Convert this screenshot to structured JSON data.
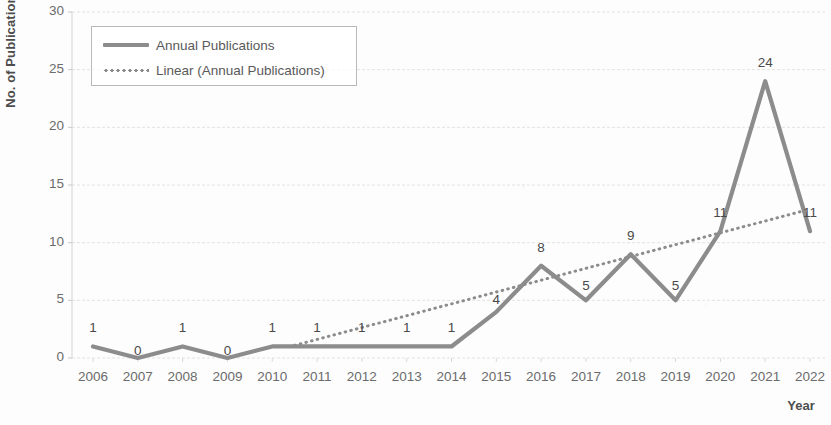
{
  "chart_data": {
    "type": "line",
    "title": "",
    "xlabel": "Year",
    "ylabel": "No. of Publications",
    "categories": [
      "2006",
      "2007",
      "2008",
      "2009",
      "2010",
      "2011",
      "2012",
      "2013",
      "2014",
      "2015",
      "2016",
      "2017",
      "2018",
      "2019",
      "2020",
      "2021",
      "2022"
    ],
    "series": [
      {
        "name": "Annual Publications",
        "style": "solid",
        "color": "#8c8c8c",
        "values": [
          1,
          0,
          1,
          0,
          1,
          1,
          1,
          1,
          1,
          4,
          8,
          5,
          9,
          5,
          11,
          24,
          11
        ],
        "data_labels": [
          "1",
          "0",
          "1",
          "0",
          "1",
          "1",
          "1",
          "1",
          "1",
          "4",
          "8",
          "5",
          "9",
          "5",
          "11",
          "24",
          "11"
        ]
      },
      {
        "name": "Linear (Annual Publications)",
        "style": "dotted",
        "color": "#8c8c8c",
        "trend_start": {
          "x_index": 4.5,
          "value": 1.1
        },
        "trend_end": {
          "x_index": 15.8,
          "value": 12.7
        },
        "values": [
          null,
          null,
          null,
          null,
          1.1,
          2.1,
          3.2,
          4.2,
          5.2,
          6.2,
          7.2,
          8.2,
          9.3,
          10.3,
          11.3,
          12.3,
          12.7
        ]
      }
    ],
    "ylim": [
      0,
      30
    ],
    "yticks": [
      0,
      5,
      10,
      15,
      20,
      25,
      30
    ],
    "ytick_labels": [
      "0",
      "5",
      "10",
      "15",
      "20",
      "25",
      "30"
    ],
    "grid": "horizontal-dashed",
    "legend_position": "top-left",
    "legend_entries": [
      {
        "label": "Annual Publications",
        "style": "solid"
      },
      {
        "label": "Linear (Annual Publications)",
        "style": "dotted"
      }
    ]
  }
}
